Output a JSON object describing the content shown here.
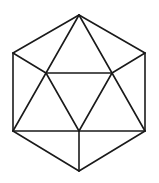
{
  "diagram": {
    "type": "geometric-line-drawing",
    "stroke_color": "#1a1a1a",
    "background_color": "#ffffff",
    "stroke_width": 1.6,
    "vertices": {
      "top": [
        79,
        15
      ],
      "top_left": [
        13,
        53
      ],
      "top_right": [
        145,
        53
      ],
      "bottom_left": [
        13,
        131
      ],
      "bottom_right": [
        145,
        131
      ],
      "bottom": [
        79,
        171
      ],
      "inner_left": [
        46,
        73
      ],
      "inner_right": [
        112,
        73
      ],
      "inner_bottom": [
        79,
        131
      ]
    },
    "edges": [
      {
        "name": "hex-top-to-top-right",
        "from": "top",
        "to": "top_right"
      },
      {
        "name": "hex-top-right-to-bottom-right",
        "from": "top_right",
        "to": "bottom_right"
      },
      {
        "name": "hex-bottom-right-to-bottom",
        "from": "bottom_right",
        "to": "bottom"
      },
      {
        "name": "hex-bottom-to-bottom-left",
        "from": "bottom",
        "to": "bottom_left"
      },
      {
        "name": "hex-bottom-left-to-top-left",
        "from": "bottom_left",
        "to": "top_left"
      },
      {
        "name": "hex-top-left-to-top",
        "from": "top_left",
        "to": "top"
      },
      {
        "name": "top-to-inner-left",
        "from": "top",
        "to": "inner_left"
      },
      {
        "name": "top-to-inner-right",
        "from": "top",
        "to": "inner_right"
      },
      {
        "name": "top-left-to-inner-left",
        "from": "top_left",
        "to": "inner_left"
      },
      {
        "name": "top-right-to-inner-right",
        "from": "top_right",
        "to": "inner_right"
      },
      {
        "name": "inner-left-to-inner-right",
        "from": "inner_left",
        "to": "inner_right"
      },
      {
        "name": "inner-left-to-bottom-left",
        "from": "inner_left",
        "to": "bottom_left"
      },
      {
        "name": "inner-right-to-bottom-right",
        "from": "inner_right",
        "to": "bottom_right"
      },
      {
        "name": "inner-left-to-inner-bottom",
        "from": "inner_left",
        "to": "inner_bottom"
      },
      {
        "name": "inner-right-to-inner-bottom",
        "from": "inner_right",
        "to": "inner_bottom"
      },
      {
        "name": "bottom-left-to-bottom-right",
        "from": "bottom_left",
        "to": "bottom_right"
      },
      {
        "name": "inner-bottom-to-bottom",
        "from": "inner_bottom",
        "to": "bottom"
      }
    ]
  }
}
